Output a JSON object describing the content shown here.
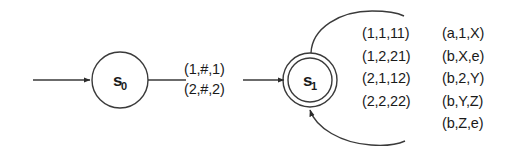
{
  "diagram": {
    "type": "pushdown-automaton-state-diagram",
    "states": [
      {
        "id": "s0",
        "label": "s",
        "subscript": "0",
        "accepting": false,
        "cx": 120,
        "cy": 80,
        "r": 28
      },
      {
        "id": "s1",
        "label": "s",
        "subscript": "1",
        "accepting": true,
        "cx": 310,
        "cy": 80,
        "r_outer": 27,
        "r_inner": 22
      }
    ],
    "start_arrow": {
      "from_x": 33,
      "to_x": 91,
      "y": 80
    },
    "transition": {
      "from": "s0",
      "to": "s1",
      "labels": [
        "(1,#,1)",
        "(2,#,2)"
      ]
    },
    "self_loop": {
      "on": "s1",
      "left_column": [
        "(1,1,11)",
        "(1,2,21)",
        "(2,1,12)",
        "(2,2,22)"
      ],
      "right_column": [
        "(a,1,X)",
        "(b,X,e)",
        "(b,2,Y)",
        "(b,Y,Z)",
        "(b,Z,e)"
      ]
    },
    "colors": {
      "stroke": "#3a3a3a",
      "text": "#1a1a1a",
      "background": "#ffffff"
    }
  }
}
